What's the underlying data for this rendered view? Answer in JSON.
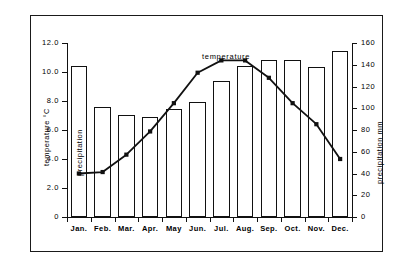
{
  "chart_data": {
    "type": "bar",
    "title": "",
    "subtitle": "",
    "xlabel": "",
    "ylabel": "temperature °C",
    "y2label": "precipitation mm",
    "grid": false,
    "legend_position": "inline-annotation",
    "categories": [
      "Jan.",
      "Feb.",
      "Mar.",
      "Apr.",
      "May",
      "Jun.",
      "Jul.",
      "Aug.",
      "Sep.",
      "Oct.",
      "Nov.",
      "Dec."
    ],
    "ylim": [
      0,
      12.0
    ],
    "y2lim": [
      0,
      160
    ],
    "yticks": [
      "0",
      "2.0",
      "4.0",
      "6.0",
      "8.0",
      "10.0",
      "12.0"
    ],
    "ytick_values": [
      0,
      2.0,
      4.0,
      6.0,
      8.0,
      10.0,
      12.0
    ],
    "y2ticks": [
      "0",
      "20",
      "40",
      "60",
      "80",
      "100",
      "120",
      "140",
      "160"
    ],
    "y2tick_values": [
      0,
      20,
      40,
      60,
      80,
      100,
      120,
      140,
      160
    ],
    "series": [
      {
        "name": "precipitation",
        "type": "bar",
        "axis": "right",
        "unit": "mm",
        "annotation": "precipitation",
        "values": [
          139,
          101,
          94,
          92,
          99,
          106,
          125,
          139,
          144,
          144,
          138,
          153
        ]
      },
      {
        "name": "temperature",
        "type": "line",
        "axis": "left",
        "unit": "°C",
        "annotation": "temperature",
        "marker": "square",
        "values": [
          3.0,
          3.1,
          4.3,
          5.9,
          7.85,
          9.95,
          10.8,
          10.8,
          9.6,
          7.85,
          6.4,
          4.0
        ]
      }
    ],
    "colors": {
      "line": "#111111",
      "marker": "#111111",
      "bar_fill": "#ffffff",
      "bar_stroke": "#111111",
      "axis": "#111111",
      "background": "#ffffff"
    }
  },
  "annotations": {
    "temperature_label": "temperature",
    "precipitation_label": "precipitation"
  },
  "axes": {
    "left_title": "temperature °C",
    "right_title": "precipitation mm"
  }
}
